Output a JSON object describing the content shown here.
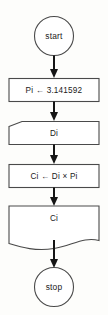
{
  "diagram": {
    "type": "flowchart",
    "title": "",
    "orientation": "top-to-bottom",
    "colors": {
      "background": "#fdfdfb",
      "shape_fill": "#ffffff",
      "shape_stroke": "#4a4a4a",
      "connector": "#151515",
      "text": "#1a1a1a"
    },
    "nodes": [
      {
        "id": "start",
        "shape": "circle",
        "label": "start",
        "role": "terminator-start"
      },
      {
        "id": "assign-pi",
        "shape": "rectangle",
        "label": "Pi ← 3.141592",
        "role": "process"
      },
      {
        "id": "input-di",
        "shape": "punched-card",
        "label": "Di",
        "role": "input"
      },
      {
        "id": "compute-ci",
        "shape": "rectangle",
        "label": "Ci ← Di × Pi",
        "role": "process"
      },
      {
        "id": "output-ci",
        "shape": "document",
        "label": "Ci",
        "role": "output"
      },
      {
        "id": "stop",
        "shape": "circle",
        "label": "stop",
        "role": "terminator-end"
      }
    ],
    "edges": [
      {
        "from": "start",
        "to": "assign-pi",
        "label": ""
      },
      {
        "from": "assign-pi",
        "to": "input-di",
        "label": ""
      },
      {
        "from": "input-di",
        "to": "compute-ci",
        "label": ""
      },
      {
        "from": "compute-ci",
        "to": "output-ci",
        "label": ""
      },
      {
        "from": "output-ci",
        "to": "stop",
        "label": ""
      }
    ]
  }
}
